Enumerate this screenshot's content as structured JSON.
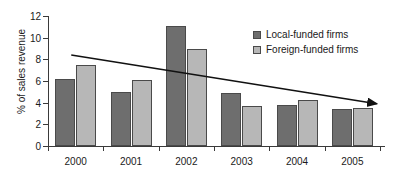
{
  "chart_data": {
    "type": "bar",
    "title": "",
    "subtitle": "",
    "xlabel": "",
    "ylabel": "% of sales revenue",
    "categories": [
      "2000",
      "2001",
      "2002",
      "2003",
      "2004",
      "2005"
    ],
    "series": [
      {
        "name": "Local-funded firms",
        "color": "#6e6e6e",
        "values": [
          6.2,
          4.95,
          11.1,
          4.85,
          3.8,
          3.4
        ]
      },
      {
        "name": "Foreign-funded firms",
        "color": "#b7b7b7",
        "values": [
          7.5,
          6.1,
          9.0,
          3.65,
          4.25,
          3.5
        ]
      }
    ],
    "ylim": [
      0,
      12
    ],
    "yticks": [
      0,
      2,
      4,
      6,
      8,
      10,
      12
    ],
    "ytick_labels": [
      "0",
      "2",
      "4",
      "6",
      "8",
      "10",
      "12"
    ],
    "grid": false,
    "legend_position": "top-right",
    "annotations": [
      {
        "name": "trend-arrow",
        "type": "arrow-line",
        "start": {
          "x_category_fraction": 0.07,
          "y": 8.4
        },
        "end": {
          "x_category_fraction": 0.99,
          "y": 3.9
        },
        "color": "#111111"
      }
    ]
  }
}
